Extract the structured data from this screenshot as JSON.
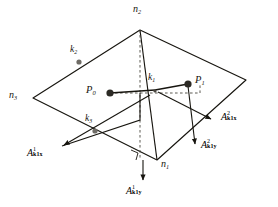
{
  "figure": {
    "type": "geometry-diagram",
    "nodes": [
      {
        "id": "n2",
        "label_base": "n",
        "label_sub": "2",
        "x": 140,
        "y": 30
      },
      {
        "id": "n3",
        "label_base": "n",
        "label_sub": "3",
        "x": 33,
        "y": 98
      },
      {
        "id": "n1",
        "label_base": "n",
        "label_sub": "1",
        "x": 157,
        "y": 160
      },
      {
        "id": "n4",
        "label_base": "",
        "label_sub": "",
        "x": 246,
        "y": 80
      }
    ],
    "midside_nodes": [
      {
        "id": "k2",
        "label_base": "k",
        "label_sub": "2",
        "x": 79,
        "y": 62
      },
      {
        "id": "k3",
        "label_base": "k",
        "label_sub": "3",
        "x": 95,
        "y": 131
      },
      {
        "id": "k1",
        "label_base": "k",
        "label_sub": "1",
        "x": 155,
        "y": 93
      }
    ],
    "points": [
      {
        "id": "P0",
        "label_base": "P",
        "label_sub": "0",
        "x": 110,
        "y": 93
      },
      {
        "id": "P1",
        "label_base": "P",
        "label_sub": "1",
        "x": 188,
        "y": 84
      }
    ],
    "vectors": [
      {
        "id": "A1k1x",
        "base": "A",
        "sup": "1",
        "sub": "k1x",
        "tail_x": 155,
        "tail_y": 93,
        "head_x": 62,
        "head_y": 146
      },
      {
        "id": "A1k1y",
        "base": "A",
        "sup": "1",
        "sub": "k1y",
        "tail_x": 143,
        "tail_y": 160,
        "head_x": 143,
        "head_y": 184
      },
      {
        "id": "A2k1x",
        "base": "A",
        "sup": "2",
        "sub": "k1x",
        "tail_x": 155,
        "tail_y": 93,
        "head_x": 213,
        "head_y": 120
      },
      {
        "id": "A2k1y",
        "base": "A",
        "sup": "2",
        "sub": "k1y",
        "tail_x": 188,
        "tail_y": 84,
        "head_x": 196,
        "head_y": 147
      }
    ],
    "labels": {
      "n2": {
        "text_base": "n",
        "text_sub": "2",
        "x": 133,
        "y": 5
      },
      "n3": {
        "text_base": "n",
        "text_sub": "3",
        "x": 10,
        "y": 90
      },
      "n1": {
        "text_base": "n",
        "text_sub": "1",
        "x": 161,
        "y": 160
      },
      "k2": {
        "text_base": "k",
        "text_sub": "2",
        "x": 71,
        "y": 45
      },
      "k3": {
        "text_base": "k",
        "text_sub": "3",
        "x": 85,
        "y": 115
      },
      "k1": {
        "text_base": "k",
        "text_sub": "1",
        "x": 149,
        "y": 74
      },
      "P0": {
        "text_base": "P",
        "text_sub": "0",
        "x": 87,
        "y": 86
      },
      "P1": {
        "text_base": "P",
        "text_sub": "1",
        "x": 196,
        "y": 75
      },
      "A1k1x": {
        "base": "A",
        "sup": "1",
        "sub": "k1x",
        "x": 27,
        "y": 148
      },
      "A1k1y": {
        "base": "A",
        "sup": "1",
        "sub": "k1y",
        "x": 126,
        "y": 186
      },
      "A2k1x": {
        "base": "A",
        "sup": "2",
        "sub": "k1x",
        "x": 222,
        "y": 112
      },
      "A2k1y": {
        "base": "A",
        "sup": "2",
        "sub": "k1y",
        "x": 202,
        "y": 140
      }
    },
    "colors": {
      "stroke": "#17150f",
      "dashed": "#4a4740",
      "node_fill": "#6f6c66",
      "background": "#ffffff"
    }
  }
}
